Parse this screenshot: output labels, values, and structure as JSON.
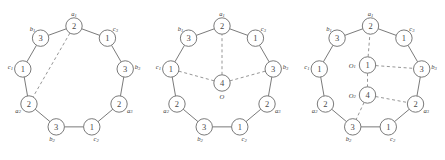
{
  "figure": {
    "background_color": "#ffffff",
    "stroke_color": "#6b6b6b",
    "dashed_stroke_color": "#8a8a8a",
    "text_color": "#3a3a3a",
    "diagram_count": 3,
    "ring_node_count": 9
  },
  "diagrams": [
    {
      "id": "diagram-1",
      "center_nodes": [],
      "ring_nodes": [
        {
          "tag": "a",
          "sub": "1",
          "value": "2",
          "angle_deg": -90,
          "tag_pos": "outside"
        },
        {
          "tag": "c",
          "sub": "3",
          "value": "1",
          "angle_deg": -50,
          "tag_pos": "outside"
        },
        {
          "tag": "b",
          "sub": "3",
          "value": "3",
          "angle_deg": -10,
          "tag_pos": "outside"
        },
        {
          "tag": "a",
          "sub": "3",
          "value": "2",
          "angle_deg": 30,
          "tag_pos": "outside"
        },
        {
          "tag": "c",
          "sub": "2",
          "value": "1",
          "angle_deg": 70,
          "tag_pos": "outside"
        },
        {
          "tag": "b",
          "sub": "2",
          "value": "3",
          "angle_deg": 110,
          "tag_pos": "outside"
        },
        {
          "tag": "a",
          "sub": "2",
          "value": "2",
          "angle_deg": 150,
          "tag_pos": "outside"
        },
        {
          "tag": "c",
          "sub": "1",
          "value": "1",
          "angle_deg": 190,
          "tag_pos": "outside"
        },
        {
          "tag": "b",
          "sub": "1",
          "value": "3",
          "angle_deg": 230,
          "tag_pos": "outside"
        }
      ],
      "dashed_edges": [
        {
          "from": "a1",
          "to": "a2"
        }
      ]
    },
    {
      "id": "diagram-2",
      "center_nodes": [
        {
          "tag": "O",
          "sub": "",
          "value": "4",
          "cx": 74,
          "cy": 83,
          "tag_pos": "below"
        }
      ],
      "ring_nodes": [
        {
          "tag": "a",
          "sub": "1",
          "value": "2",
          "angle_deg": -90,
          "tag_pos": "outside"
        },
        {
          "tag": "c",
          "sub": "3",
          "value": "1",
          "angle_deg": -50,
          "tag_pos": "outside"
        },
        {
          "tag": "b",
          "sub": "3",
          "value": "3",
          "angle_deg": -10,
          "tag_pos": "outside"
        },
        {
          "tag": "a",
          "sub": "3",
          "value": "2",
          "angle_deg": 30,
          "tag_pos": "outside"
        },
        {
          "tag": "c",
          "sub": "2",
          "value": "1",
          "angle_deg": 70,
          "tag_pos": "outside"
        },
        {
          "tag": "b",
          "sub": "2",
          "value": "3",
          "angle_deg": 110,
          "tag_pos": "outside"
        },
        {
          "tag": "a",
          "sub": "2",
          "value": "2",
          "angle_deg": 150,
          "tag_pos": "outside"
        },
        {
          "tag": "c",
          "sub": "1",
          "value": "1",
          "angle_deg": 190,
          "tag_pos": "outside"
        },
        {
          "tag": "b",
          "sub": "1",
          "value": "3",
          "angle_deg": 230,
          "tag_pos": "outside"
        }
      ],
      "dashed_edges": [
        {
          "from": "O",
          "to": "a1"
        },
        {
          "from": "O",
          "to": "c1"
        },
        {
          "from": "O",
          "to": "b3"
        }
      ]
    },
    {
      "id": "diagram-3",
      "center_nodes": [
        {
          "tag": "O",
          "sub": "1",
          "value": "1",
          "cx": 71,
          "cy": 65,
          "tag_pos": "left"
        },
        {
          "tag": "O",
          "sub": "2",
          "value": "4",
          "cx": 71,
          "cy": 95,
          "tag_pos": "left"
        }
      ],
      "ring_nodes": [
        {
          "tag": "a",
          "sub": "1",
          "value": "2",
          "angle_deg": -90,
          "tag_pos": "outside"
        },
        {
          "tag": "c",
          "sub": "3",
          "value": "1",
          "angle_deg": -50,
          "tag_pos": "outside"
        },
        {
          "tag": "b",
          "sub": "3",
          "value": "3",
          "angle_deg": -10,
          "tag_pos": "outside"
        },
        {
          "tag": "a",
          "sub": "3",
          "value": "2",
          "angle_deg": 30,
          "tag_pos": "outside"
        },
        {
          "tag": "c",
          "sub": "2",
          "value": "1",
          "angle_deg": 70,
          "tag_pos": "outside"
        },
        {
          "tag": "b",
          "sub": "2",
          "value": "3",
          "angle_deg": 110,
          "tag_pos": "outside"
        },
        {
          "tag": "a",
          "sub": "2",
          "value": "2",
          "angle_deg": 150,
          "tag_pos": "outside"
        },
        {
          "tag": "c",
          "sub": "1",
          "value": "1",
          "angle_deg": 190,
          "tag_pos": "outside"
        },
        {
          "tag": "b",
          "sub": "1",
          "value": "3",
          "angle_deg": 230,
          "tag_pos": "outside"
        }
      ],
      "dashed_edges": [
        {
          "from": "O1",
          "to": "a1"
        },
        {
          "from": "O1",
          "to": "b3"
        },
        {
          "from": "O1",
          "to": "O2"
        },
        {
          "from": "O2",
          "to": "a3"
        },
        {
          "from": "O2",
          "to": "b2"
        }
      ]
    }
  ]
}
